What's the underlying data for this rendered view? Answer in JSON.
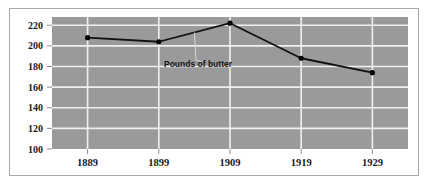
{
  "chart_data": {
    "type": "line",
    "title": "",
    "subtitle": "",
    "xlabel": "",
    "ylabel": "",
    "categories": [
      "1889",
      "1899",
      "1909",
      "1919",
      "1929"
    ],
    "x": [
      1889,
      1899,
      1909,
      1919,
      1929
    ],
    "series": [
      {
        "name": "Pounds of butter",
        "values": [
          208,
          204,
          222,
          188,
          174
        ]
      }
    ],
    "values": [
      208,
      204,
      222,
      188,
      174
    ],
    "ylim": [
      100,
      228
    ],
    "xlim": [
      1884,
      1934
    ],
    "yticks": [
      100,
      120,
      140,
      160,
      180,
      200,
      220
    ],
    "ytick_labels": [
      "100",
      "120",
      "140",
      "160",
      "180",
      "200",
      "220"
    ],
    "xticks": [
      1889,
      1899,
      1909,
      1919,
      1929
    ],
    "xtick_labels": [
      "1889",
      "1899",
      "1909",
      "1919",
      "1929"
    ],
    "grid": true,
    "grid_axes": "both",
    "legend": false,
    "legend_position": "none",
    "annotations": [
      {
        "text": "Pounds of butter",
        "target_x": 1904,
        "target_y": 213
      }
    ],
    "colors": {
      "plot_background": "#9a9a9a",
      "gridline": "#f0f0f0",
      "series_line": "#111111",
      "marker": "#000000",
      "frame_border": "#a9a9a9",
      "page_background": "#ffffff",
      "tick_label": "#1a1a1a",
      "annotation_text": "#141414",
      "leader_line": "#d8d8d8"
    }
  }
}
